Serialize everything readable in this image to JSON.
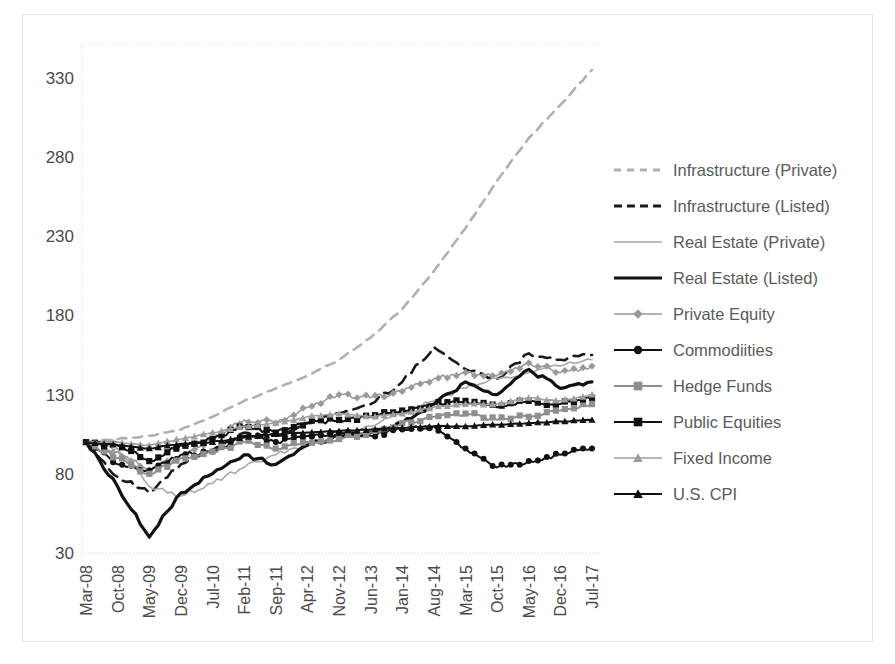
{
  "chart_data": {
    "type": "line",
    "title": "",
    "xlabel": "",
    "ylabel": "",
    "ylim": [
      30,
      340
    ],
    "yticks": [
      30,
      80,
      130,
      180,
      230,
      280,
      330
    ],
    "grid": false,
    "legend_position": "right",
    "x": [
      "Mar-08",
      "Oct-08",
      "May-09",
      "Dec-09",
      "Jul-10",
      "Feb-11",
      "Sep-11",
      "Apr-12",
      "Nov-12",
      "Jun-13",
      "Jan-14",
      "Aug-14",
      "Mar-15",
      "Oct-15",
      "May-16",
      "Dec-16",
      "Jul-17"
    ],
    "x_tick_interval_months": 7,
    "series": [
      {
        "name": "Infrastructure (Private)",
        "color": "#b0b0b0",
        "style": "dashed",
        "marker": "none",
        "values": [
          100,
          102,
          104,
          108,
          116,
          126,
          134,
          142,
          152,
          166,
          184,
          208,
          235,
          265,
          292,
          313,
          335
        ]
      },
      {
        "name": "Infrastructure (Listed)",
        "color": "#1a1a1a",
        "style": "dashed",
        "marker": "none",
        "values": [
          100,
          78,
          68,
          86,
          95,
          106,
          104,
          112,
          118,
          124,
          138,
          160,
          146,
          140,
          156,
          152,
          155
        ]
      },
      {
        "name": "Real Estate (Private)",
        "color": "#a8a8a8",
        "style": "solid-thin",
        "marker": "none",
        "values": [
          100,
          96,
          72,
          66,
          74,
          84,
          92,
          98,
          104,
          110,
          118,
          126,
          134,
          140,
          144,
          148,
          152
        ]
      },
      {
        "name": "Real Estate (Listed)",
        "color": "#111111",
        "style": "solid-thick",
        "marker": "none",
        "values": [
          100,
          72,
          40,
          68,
          80,
          92,
          86,
          98,
          104,
          106,
          112,
          124,
          138,
          130,
          146,
          134,
          138
        ]
      },
      {
        "name": "Private Equity",
        "color": "#9a9a9a",
        "style": "solid-thin",
        "marker": "diamond",
        "values": [
          100,
          94,
          82,
          92,
          102,
          114,
          112,
          122,
          130,
          128,
          132,
          140,
          144,
          142,
          150,
          144,
          148
        ]
      },
      {
        "name": "Commodiities",
        "color": "#111111",
        "style": "solid",
        "marker": "circle",
        "values": [
          100,
          86,
          82,
          92,
          94,
          104,
          100,
          104,
          106,
          104,
          108,
          110,
          96,
          84,
          88,
          92,
          96
        ]
      },
      {
        "name": "Hedge Funds",
        "color": "#8f8f8f",
        "style": "solid",
        "marker": "square",
        "values": [
          100,
          90,
          80,
          90,
          94,
          100,
          96,
          100,
          102,
          106,
          112,
          116,
          118,
          114,
          116,
          120,
          124
        ]
      },
      {
        "name": "Public Equities",
        "color": "#111111",
        "style": "solid",
        "marker": "square",
        "values": [
          100,
          98,
          88,
          98,
          102,
          110,
          106,
          112,
          114,
          116,
          120,
          124,
          126,
          122,
          126,
          124,
          128
        ]
      },
      {
        "name": "Fixed Income",
        "color": "#9e9e9e",
        "style": "solid-thin",
        "marker": "triangle",
        "values": [
          100,
          100,
          98,
          102,
          106,
          110,
          112,
          116,
          118,
          116,
          118,
          122,
          124,
          124,
          128,
          126,
          130
        ]
      },
      {
        "name": "U.S. CPI",
        "color": "#111111",
        "style": "solid",
        "marker": "triangle",
        "values": [
          100,
          98,
          96,
          99,
          100,
          103,
          105,
          106,
          107,
          108,
          109,
          110,
          110,
          111,
          112,
          113,
          114
        ]
      }
    ]
  },
  "legend": {
    "items": [
      {
        "label": "Infrastructure (Private)"
      },
      {
        "label": "Infrastructure (Listed)"
      },
      {
        "label": "Real Estate (Private)"
      },
      {
        "label": "Real Estate (Listed)"
      },
      {
        "label": "Private Equity"
      },
      {
        "label": "Commodiities"
      },
      {
        "label": "Hedge Funds"
      },
      {
        "label": "Public Equities"
      },
      {
        "label": "Fixed Income"
      },
      {
        "label": "U.S. CPI"
      }
    ]
  },
  "axes": {
    "y_tick_labels": [
      "330",
      "280",
      "230",
      "180",
      "130",
      "80",
      "30"
    ],
    "x_tick_labels": [
      "Mar-08",
      "Oct-08",
      "May-09",
      "Dec-09",
      "Jul-10",
      "Feb-11",
      "Sep-11",
      "Apr-12",
      "Nov-12",
      "Jun-13",
      "Jan-14",
      "Aug-14",
      "Mar-15",
      "Oct-15",
      "May-16",
      "Dec-16",
      "Jul-17"
    ]
  },
  "colors": {
    "axis_text": "#4a4a4a",
    "legend_text": "#5a5a5a",
    "frame": "#e3e3e3",
    "dark_series": "#111111",
    "light_series": "#a8a8a8"
  }
}
